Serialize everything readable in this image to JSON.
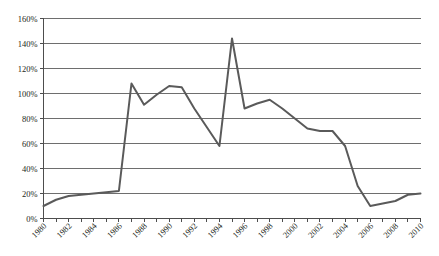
{
  "chart_data": {
    "type": "line",
    "title": "",
    "subtitle": "",
    "xlabel": "",
    "ylabel": "",
    "ylim": [
      0,
      160
    ],
    "xlim": [
      1980,
      2010
    ],
    "grid": "horizontal",
    "legend": "none",
    "y_ticks": [
      0,
      20,
      40,
      60,
      80,
      100,
      120,
      140,
      160
    ],
    "y_tick_labels": [
      "0%",
      "20%",
      "40%",
      "60%",
      "80%",
      "100%",
      "120%",
      "140%",
      "160%"
    ],
    "y_tick_suffix": "%",
    "x_tick_labels": [
      "1980",
      "1982",
      "1984",
      "1986",
      "1988",
      "1990",
      "1992",
      "1994",
      "1996",
      "1998",
      "2000",
      "2002",
      "2004",
      "2006",
      "2008",
      "2010"
    ],
    "x_minor_tick_interval": 1,
    "x_label_interval": 2,
    "x_label_rotation": -45,
    "series": [
      {
        "name": "",
        "color": "#5a5a5a",
        "line_width": 2,
        "markers": "none",
        "x": [
          1980,
          1981,
          1982,
          1983,
          1984,
          1985,
          1986,
          1987,
          1988,
          1989,
          1990,
          1991,
          1992,
          1993,
          1994,
          1995,
          1996,
          1997,
          1998,
          1999,
          2000,
          2001,
          2002,
          2003,
          2004,
          2005,
          2006,
          2007,
          2008,
          2009,
          2010
        ],
        "values": [
          10,
          15,
          18,
          19,
          20,
          21,
          22,
          108,
          91,
          99,
          106,
          105,
          88,
          73,
          58,
          144,
          88,
          92,
          95,
          88,
          80,
          72,
          70,
          70,
          58,
          26,
          10,
          12,
          14,
          19,
          20
        ]
      }
    ]
  },
  "axes": {
    "y_axis_name": "percent-axis",
    "x_axis_name": "year-axis"
  }
}
